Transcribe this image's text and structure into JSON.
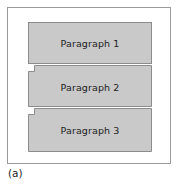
{
  "figure": {
    "caption": "(a)",
    "frame_border_color": "#9a9a9a",
    "block_fill_color": "#c9c9c9",
    "block_border_color": "#8c8c8c",
    "text_color": "#1d1d1d",
    "background_color": "#ffffff",
    "blocks": [
      {
        "label": "Paragraph 1",
        "shape": "rectangle",
        "indent_notch": false
      },
      {
        "label": "Paragraph 2",
        "shape": "notched-rectangle",
        "indent_notch": true
      },
      {
        "label": "Paragraph 3",
        "shape": "notched-rectangle",
        "indent_notch": true
      }
    ]
  }
}
